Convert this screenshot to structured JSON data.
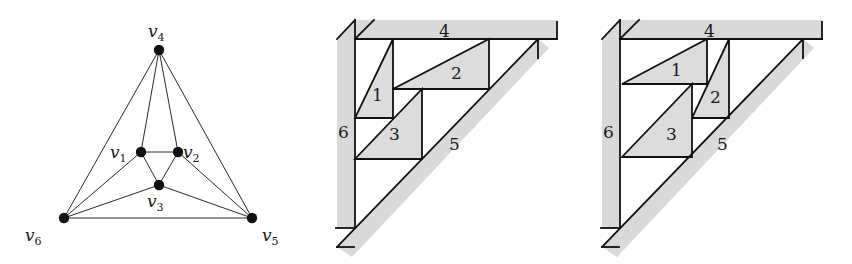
{
  "figure": {
    "panels": [
      {
        "id": "graph",
        "kind": "planar-graph",
        "vertices": [
          {
            "id": "v1",
            "name": "v",
            "sub": "1"
          },
          {
            "id": "v2",
            "name": "v",
            "sub": "2"
          },
          {
            "id": "v3",
            "name": "v",
            "sub": "3"
          },
          {
            "id": "v4",
            "name": "v",
            "sub": "4"
          },
          {
            "id": "v5",
            "name": "v",
            "sub": "5"
          },
          {
            "id": "v6",
            "name": "v",
            "sub": "6"
          }
        ],
        "edges": [
          [
            "v1",
            "v2"
          ],
          [
            "v1",
            "v3"
          ],
          [
            "v2",
            "v3"
          ],
          [
            "v4",
            "v1"
          ],
          [
            "v4",
            "v2"
          ],
          [
            "v4",
            "v6"
          ],
          [
            "v4",
            "v5"
          ],
          [
            "v1",
            "v6"
          ],
          [
            "v2",
            "v5"
          ],
          [
            "v3",
            "v6"
          ],
          [
            "v3",
            "v5"
          ],
          [
            "v6",
            "v5"
          ]
        ]
      },
      {
        "id": "contact-a",
        "kind": "contact-representation",
        "sides": {
          "top": "4",
          "left": "6",
          "diagonal": "5"
        },
        "triangles": [
          {
            "id": "t1",
            "label": "1"
          },
          {
            "id": "t2",
            "label": "2"
          },
          {
            "id": "t3",
            "label": "3"
          }
        ]
      },
      {
        "id": "contact-b",
        "kind": "contact-representation",
        "sides": {
          "top": "4",
          "left": "6",
          "diagonal": "5"
        },
        "triangles": [
          {
            "id": "t1",
            "label": "1"
          },
          {
            "id": "t2",
            "label": "2"
          },
          {
            "id": "t3",
            "label": "3"
          }
        ]
      }
    ],
    "colors": {
      "ink": "#111111",
      "fill": "#dcdcdc",
      "background": "#ffffff"
    }
  }
}
